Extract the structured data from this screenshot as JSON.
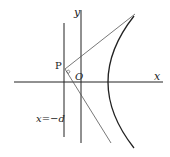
{
  "diagram": {
    "type": "parabola-tangent-lines",
    "labels": {
      "y_axis": "y",
      "x_axis": "x",
      "origin": "O",
      "point": "P",
      "directrix": "x=−d"
    },
    "colors": {
      "stroke": "#222222",
      "thin_stroke": "#555555",
      "background": "#ffffff"
    }
  }
}
